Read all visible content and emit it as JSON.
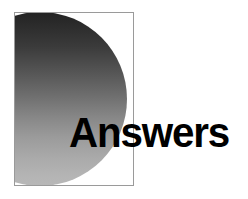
{
  "graphic": {
    "title": "Answers section divider",
    "headline": "Answers",
    "panel": {
      "border_color": "#9a9a9a",
      "background_color": "#ffffff"
    },
    "disc": {
      "shape": "circle",
      "gradient_from": "#232323",
      "gradient_to": "#b8b8b8",
      "gradient_direction": "top-to-bottom"
    },
    "text_color": "#000000"
  }
}
